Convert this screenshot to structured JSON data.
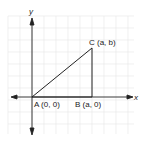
{
  "diagram": {
    "axes": {
      "x_label": "x",
      "y_label": "y"
    },
    "points": [
      {
        "name": "A",
        "coords": "(0, 0)",
        "label": "A (0, 0)"
      },
      {
        "name": "B",
        "coords": "(a, 0)",
        "label": "B (a, 0)"
      },
      {
        "name": "C",
        "coords": "(a, b)",
        "label": "C (a, b)"
      }
    ],
    "shape": "right triangle ABC",
    "colors": {
      "grid": "#e3e3e3",
      "axis": "#222222",
      "triangle": "#222222"
    }
  }
}
